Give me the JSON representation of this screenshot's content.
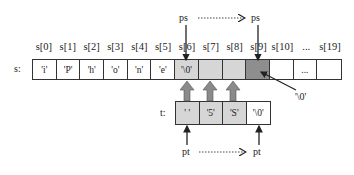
{
  "diagram": {
    "source_array": {
      "label": "s:",
      "indices": [
        "s[0]",
        "s[1]",
        "s[2]",
        "s[3]",
        "s[4]",
        "s[5]",
        "s[6]",
        "s[7]",
        "s[8]",
        "s[9]",
        "s[10]",
        "...",
        "s[19]"
      ],
      "cells": [
        {
          "value": "'i'",
          "fill": "#ffffff"
        },
        {
          "value": "'P'",
          "fill": "#ffffff"
        },
        {
          "value": "'h'",
          "fill": "#ffffff"
        },
        {
          "value": "'o'",
          "fill": "#ffffff"
        },
        {
          "value": "'n'",
          "fill": "#ffffff"
        },
        {
          "value": "'e'",
          "fill": "#ffffff"
        },
        {
          "value": "'\\0'",
          "fill": "#d6d6d6"
        },
        {
          "value": "",
          "fill": "#d6d6d6"
        },
        {
          "value": "",
          "fill": "#d6d6d6"
        },
        {
          "value": "",
          "fill": "#8e8e8e"
        },
        {
          "value": "",
          "fill": "#ffffff"
        },
        {
          "value": "...",
          "fill": "#ffffff"
        },
        {
          "value": "",
          "fill": "#ffffff"
        }
      ]
    },
    "target_array": {
      "label": "t:",
      "cells": [
        {
          "value": "' '",
          "fill": "#d6d6d6"
        },
        {
          "value": "'5'",
          "fill": "#d6d6d6"
        },
        {
          "value": "'S'",
          "fill": "#d6d6d6"
        },
        {
          "value": "'\\0'",
          "fill": "#ffffff"
        }
      ]
    },
    "pointers": {
      "ps_start": "ps",
      "ps_end": "ps",
      "pt_start": "pt",
      "pt_end": "pt"
    },
    "annotation": {
      "null_terminator_label": "'\\0'"
    },
    "colors": {
      "copied_fill": "#d6d6d6",
      "terminator_fill": "#8e8e8e",
      "block_arrow": "#8a8a8a",
      "stroke": "#333333"
    }
  }
}
